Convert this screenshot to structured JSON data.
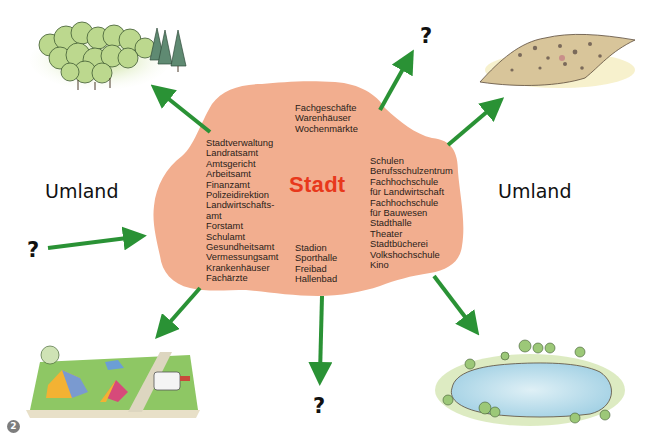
{
  "diagram": {
    "center": {
      "title": "Stadt",
      "title_color": "#e8381c",
      "blob_color": "#f2ae8f",
      "groups": {
        "trade": [
          "Fachgeschäfte",
          "Warenhäuser",
          "Wochenmärkte"
        ],
        "administration": [
          "Stadtverwaltung",
          "Landratsamt",
          "Amtsgericht",
          "Arbeitsamt",
          "Finanzamt",
          "Polizeidirektion",
          "Landwirtschafts-",
          "amt",
          "Forstamt",
          "Schulamt",
          "Gesundheitsamt",
          "Vermessungsamt",
          "Krankenhäuser",
          "Fachärzte"
        ],
        "education_culture": [
          "Schulen",
          "Berufsschulzentrum",
          "Fachhochschule",
          "für Landwirtschaft",
          "Fachhochschule",
          "für Bauwesen",
          "Stadthalle",
          "Theater",
          "Stadtbücherei",
          "Volkshochschule",
          "Kino"
        ],
        "sports": [
          "Stadion",
          "Sporthalle",
          "Freibad",
          "Hallenbad"
        ]
      }
    },
    "labels": {
      "umland_left": "Umland",
      "umland_right": "Umland",
      "question_top": "?",
      "question_left": "?",
      "question_bottom": "?"
    },
    "arrow_color": "#2a9235",
    "illustrations": [
      {
        "id": "forest",
        "icon": "forest-icon",
        "position": "top-left"
      },
      {
        "id": "quarry",
        "icon": "gravel-pit-icon",
        "position": "top-right"
      },
      {
        "id": "campsite",
        "icon": "campsite-icon",
        "position": "bottom-left"
      },
      {
        "id": "lake",
        "icon": "lake-icon",
        "position": "bottom-right"
      }
    ],
    "figure_number": "2"
  }
}
